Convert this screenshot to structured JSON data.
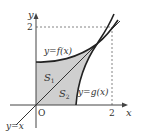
{
  "figure": {
    "axis_labels": {
      "x": "x",
      "y": "y",
      "origin": "O"
    },
    "ticks": {
      "x_tick": "2",
      "y_tick": "2"
    },
    "curves": {
      "f_label": "y=f(x)",
      "g_label": "y=g(x)",
      "line_label": "y=x"
    },
    "regions": {
      "s1": {
        "letter": "S",
        "sub": "1"
      },
      "s2": {
        "letter": "S",
        "sub": "2"
      }
    },
    "colors": {
      "shade": "#cfcfcf",
      "curve": "#222222",
      "axis": "#444444",
      "dashed": "#666666"
    }
  }
}
